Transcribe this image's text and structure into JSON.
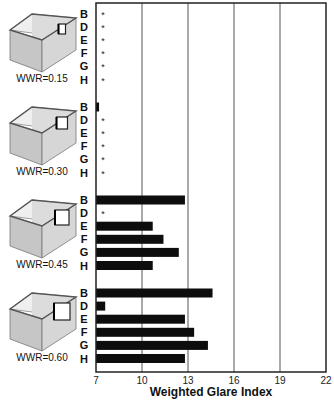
{
  "chart_data": {
    "type": "bar",
    "orientation": "horizontal",
    "title": "",
    "xlabel": "Weighted Glare Index",
    "ylabel": "",
    "xlim": [
      7,
      22
    ],
    "xticks": [
      7,
      10,
      13,
      16,
      19,
      22
    ],
    "grid": "vertical",
    "legend": "none",
    "categories": [
      "B",
      "D",
      "E",
      "F",
      "G",
      "H"
    ],
    "marker_note": "* = value at or below axis minimum (no visible bar)",
    "groups": [
      {
        "name": "WWR=0.15",
        "icon": "room-window-small-icon",
        "values": [
          null,
          null,
          null,
          null,
          null,
          null
        ],
        "markers": [
          "*",
          "*",
          "*",
          "*",
          "*",
          "*"
        ]
      },
      {
        "name": "WWR=0.30",
        "icon": "room-window-medium-icon",
        "values": [
          7.2,
          null,
          null,
          null,
          null,
          null
        ],
        "markers": [
          "",
          "*",
          "*",
          "*",
          "*",
          "*"
        ]
      },
      {
        "name": "WWR=0.45",
        "icon": "room-window-large-icon",
        "values": [
          12.8,
          null,
          10.7,
          11.4,
          12.4,
          10.7
        ],
        "markers": [
          "",
          "*",
          "",
          "",
          "",
          ""
        ]
      },
      {
        "name": "WWR=0.60",
        "icon": "room-window-xlarge-icon",
        "values": [
          14.6,
          7.6,
          12.8,
          13.4,
          14.3,
          12.8
        ],
        "markers": [
          "",
          "",
          "",
          "",
          "",
          ""
        ]
      }
    ],
    "colors": {
      "bar": "#0d0d0d",
      "grid": "#555555",
      "frame": "#222222"
    }
  }
}
